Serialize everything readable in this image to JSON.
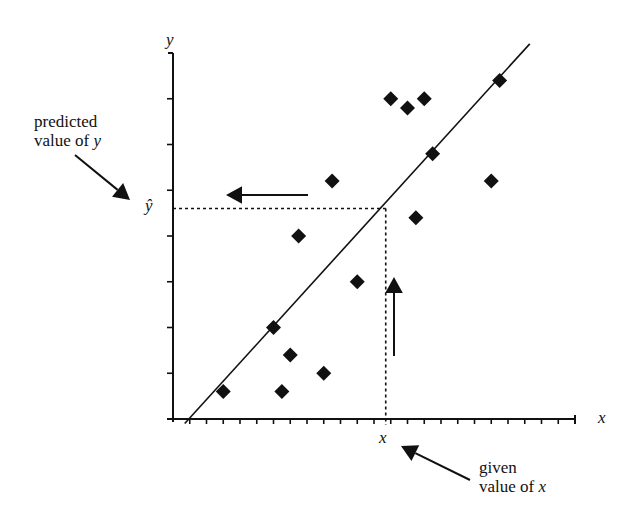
{
  "chart_data": {
    "type": "scatter",
    "title": "",
    "xlabel": "x",
    "ylabel": "y",
    "grid": false,
    "legend": null,
    "axis_ticks": {
      "x_tick_count": 25,
      "y_tick_count": 8,
      "x_tick_labels": [],
      "y_tick_labels": []
    },
    "xlim": [
      0,
      24
    ],
    "ylim": [
      0,
      8
    ],
    "points": [
      {
        "x": 3.0,
        "y": 0.6
      },
      {
        "x": 6.0,
        "y": 2.0
      },
      {
        "x": 7.0,
        "y": 1.4
      },
      {
        "x": 6.5,
        "y": 0.6
      },
      {
        "x": 9.0,
        "y": 1.0
      },
      {
        "x": 11.0,
        "y": 3.0
      },
      {
        "x": 7.5,
        "y": 4.0
      },
      {
        "x": 9.5,
        "y": 5.2
      },
      {
        "x": 13.0,
        "y": 7.0
      },
      {
        "x": 14.0,
        "y": 6.8
      },
      {
        "x": 15.0,
        "y": 7.0
      },
      {
        "x": 15.5,
        "y": 5.8
      },
      {
        "x": 14.5,
        "y": 4.4
      },
      {
        "x": 19.0,
        "y": 5.2
      },
      {
        "x": 19.5,
        "y": 7.4
      }
    ],
    "regression_line": {
      "x0": 0.7,
      "y0": -0.1,
      "x1": 21.3,
      "y1": 8.2
    },
    "prediction": {
      "given_x": 12.7,
      "predicted_y": 4.6,
      "given_x_label": "x",
      "predicted_y_label": "ŷ"
    },
    "annotations": [
      {
        "text_line1": "predicted",
        "text_line2": "value of ",
        "var": "y",
        "points_to": "ŷ"
      },
      {
        "text_line1": "given",
        "text_line2": "value of ",
        "var": "x",
        "points_to": "x"
      }
    ]
  },
  "labels": {
    "y_axis": "y",
    "x_axis": "x",
    "y_hat": "ŷ",
    "x_given": "x",
    "predicted_line1": "predicted",
    "predicted_line2": "value of ",
    "predicted_var": "y",
    "given_line1": "given",
    "given_line2": "value of ",
    "given_var": "x"
  },
  "colors": {
    "ink": "#111111",
    "background": "#ffffff"
  }
}
